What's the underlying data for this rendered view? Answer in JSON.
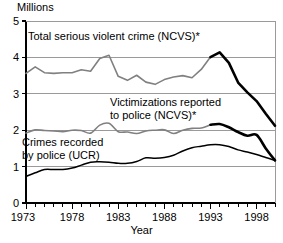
{
  "chart_data": {
    "type": "line",
    "title": "",
    "ylabel": "Millions",
    "xlabel": "Year",
    "ylim": [
      0,
      5
    ],
    "xlim": [
      1973,
      2000
    ],
    "ytick_labels": [
      "0",
      "1",
      "2",
      "3",
      "4",
      "5"
    ],
    "yticks": [
      0,
      1,
      2,
      3,
      4,
      5
    ],
    "xtick_labels": [
      "1973",
      "1978",
      "1983",
      "1988",
      "1993",
      "1998"
    ],
    "xticks": [
      1973,
      1978,
      1983,
      1988,
      1993,
      1998
    ],
    "minor_xticks_every": 1,
    "grid": "horizontal",
    "legend": "inline-annotations",
    "x": [
      1973,
      1974,
      1975,
      1976,
      1977,
      1978,
      1979,
      1980,
      1981,
      1982,
      1983,
      1984,
      1985,
      1986,
      1987,
      1988,
      1989,
      1990,
      1991,
      1992,
      1993,
      1994,
      1995,
      1996,
      1997,
      1998,
      1999,
      2000
    ],
    "series": [
      {
        "name": "Total serious violent crime (NCVS)*",
        "color": "#808080",
        "color_late": "#000000",
        "split_year": 1993,
        "values": [
          3.56,
          3.74,
          3.58,
          3.56,
          3.58,
          3.58,
          3.66,
          3.62,
          3.97,
          4.06,
          3.48,
          3.37,
          3.51,
          3.32,
          3.26,
          3.39,
          3.46,
          3.5,
          3.44,
          3.67,
          4.01,
          4.14,
          3.85,
          3.31,
          3.04,
          2.8,
          2.45,
          2.12
        ]
      },
      {
        "name": "Victimizations reported to police (NCVS)*",
        "color": "#808080",
        "color_late": "#000000",
        "split_year": 1993,
        "values": [
          1.92,
          2.01,
          1.99,
          1.98,
          1.96,
          2.0,
          1.99,
          1.92,
          2.14,
          2.19,
          1.96,
          1.95,
          1.91,
          1.98,
          2.0,
          2.01,
          1.91,
          2.0,
          2.05,
          2.06,
          2.15,
          2.17,
          2.08,
          1.95,
          1.85,
          1.87,
          1.5,
          1.17
        ]
      },
      {
        "name": "Crimes recorded by police (UCR)",
        "color": "#000000",
        "values": [
          0.73,
          0.83,
          0.92,
          0.92,
          0.92,
          0.96,
          1.04,
          1.12,
          1.13,
          1.12,
          1.09,
          1.09,
          1.14,
          1.24,
          1.23,
          1.25,
          1.31,
          1.43,
          1.52,
          1.56,
          1.6,
          1.6,
          1.55,
          1.46,
          1.4,
          1.33,
          1.25,
          1.17
        ]
      }
    ],
    "annotations": [
      {
        "id": "ann-total",
        "lines": [
          "Total serious violent crime (NCVS)*"
        ],
        "x_px": 28,
        "y_px": 40
      },
      {
        "id": "ann-reported",
        "lines": [
          "Victimizations reported",
          "to police (NCVS)*"
        ],
        "x_px": 110,
        "y_px": 106
      },
      {
        "id": "ann-ucr",
        "lines": [
          "Crimes recorded",
          "by police (UCR)"
        ],
        "x_px": 22,
        "y_px": 146
      }
    ],
    "footnote_marker": "*"
  },
  "colors": {
    "ncvs_gray": "#808080",
    "ucr_black": "#000000",
    "gridline": "#9a9a9a",
    "axis": "#000000",
    "background": "#ffffff"
  }
}
